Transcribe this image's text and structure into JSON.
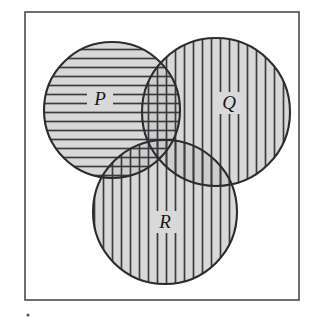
{
  "figure": {
    "kind": "venn-diagram-3",
    "background_color": "#ffffff"
  },
  "frame": {
    "name": "universal-set-rectangle",
    "x": 25,
    "y": 12,
    "width": 274,
    "height": 288,
    "stroke_color": "#4a4a4f",
    "stroke_width": 1.6,
    "fill_color": "#ffffff"
  },
  "style": {
    "circle_fill": "#c9c9c9",
    "circle_fill_opacity": 0.72,
    "circle_stroke": "#2b2b30",
    "circle_stroke_width": 2.1,
    "hatch_color": "#3a3a3f",
    "hatch_width": 1.7,
    "hatch_spacing": 9,
    "label_plate_fill": "#d9d9d9"
  },
  "sets": [
    {
      "id": "P",
      "label": "P",
      "hatch": "horizontal",
      "cx": 112,
      "cy": 110,
      "r": 68,
      "label_x": 100,
      "label_y": 103
    },
    {
      "id": "Q",
      "label": "Q",
      "hatch": "vertical",
      "cx": 216,
      "cy": 112,
      "r": 74,
      "label_x": 229,
      "label_y": 107
    },
    {
      "id": "R",
      "label": "R",
      "hatch": "vertical",
      "cx": 165,
      "cy": 212,
      "r": 72,
      "label_x": 165,
      "label_y": 226
    }
  ],
  "regions": [
    {
      "id": "P-only",
      "description": "P only",
      "pattern": "horizontal"
    },
    {
      "id": "Q-only",
      "description": "Q only",
      "pattern": "vertical"
    },
    {
      "id": "R-only",
      "description": "R only",
      "pattern": "vertical"
    },
    {
      "id": "P-and-Q",
      "description": "P intersect Q",
      "pattern": "cross-hatch"
    },
    {
      "id": "P-and-R",
      "description": "P intersect R",
      "pattern": "cross-hatch"
    },
    {
      "id": "Q-and-R",
      "description": "Q intersect R",
      "pattern": "vertical"
    },
    {
      "id": "P-Q-R",
      "description": "P intersect Q intersect R",
      "pattern": "cross-hatch"
    }
  ],
  "artifacts": {
    "scan_dot": {
      "name": "scan-speck",
      "x": 28,
      "y": 315,
      "r": 1.6,
      "color": "#5a5a5f"
    }
  }
}
